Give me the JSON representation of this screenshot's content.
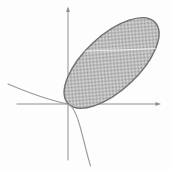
{
  "figure": {
    "canvas": {
      "width": 171,
      "height": 170,
      "background": "#fdfdfd"
    },
    "axes": {
      "color": "#8f8f8f",
      "stroke_width": 1,
      "x_axis": {
        "x1": 17,
        "y1": 104,
        "x2": 158,
        "y2": 104
      },
      "y_axis": {
        "x1": 68,
        "y1": 9,
        "x2": 68,
        "y2": 160
      },
      "x_arrow_points": "161,104 155.5,102.1 155.5,105.9",
      "y_arrow_points": "68,6.5 66.1,12 69.9,12"
    },
    "ellipse": {
      "cx": 111.6,
      "cy": 63,
      "rx": 59.5,
      "ry": 27.5,
      "transform": "rotate(-43 111.6 63)",
      "stroke": "#6f6f6f",
      "stroke_width": 1.4,
      "fill_ref": "url(#dither)",
      "hatch_light": "#e1e1e1",
      "hatch_dark": "#979797"
    },
    "chord": {
      "x1": 78,
      "y1": 51.5,
      "x2": 158,
      "y2": 48.5,
      "color": "#f0f0f0",
      "stroke_width": 1.2,
      "clip_ref": "url(#ellipseClip)"
    },
    "curve": {
      "d": "M 8 84 C 28 92.5, 52 100.8, 67 103.8 C 72.5 105, 76 113, 79 123 C 82.3 133.5, 86 151, 90.5 166",
      "color": "#9a9a9a",
      "stroke_width": 1.1
    }
  }
}
